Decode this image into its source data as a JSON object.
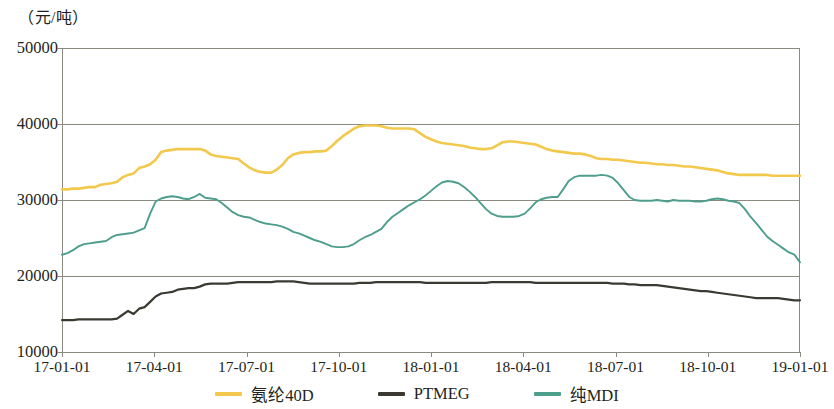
{
  "chart_data": {
    "type": "line",
    "title": "",
    "subtitle": "",
    "unit_label": "（元/吨）",
    "xlabel": "",
    "ylabel": "元/吨",
    "grid": true,
    "legend_position": "bottom",
    "ylim": [
      10000,
      50000
    ],
    "yticks": [
      50000,
      40000,
      30000,
      20000,
      10000
    ],
    "ytick_labels": [
      "50000",
      "40000",
      "30000",
      "20000",
      "10000"
    ],
    "xticks": [
      "17-01-01",
      "17-04-01",
      "17-07-01",
      "17-10-01",
      "18-01-01",
      "18-04-01",
      "18-07-01",
      "18-10-01",
      "19-01-01"
    ],
    "x_range": [
      "17-01-01",
      "19-01-01"
    ],
    "colors": {
      "spandex40d": "#f2c94c",
      "ptmeg": "#3a3a33",
      "puremdi": "#4d9e8c",
      "grid": "#8a8a80",
      "axis": "#8a8a80",
      "text": "#231f20"
    },
    "series": [
      {
        "name": "氨纶40D",
        "color": "#f2c94c",
        "values": [
          31400,
          31400,
          31500,
          31500,
          31600,
          31700,
          31700,
          32000,
          32100,
          32200,
          32400,
          33000,
          33300,
          33500,
          34200,
          34400,
          34700,
          35300,
          36300,
          36500,
          36600,
          36700,
          36700,
          36700,
          36700,
          36700,
          36500,
          36000,
          35800,
          35700,
          35600,
          35500,
          35400,
          34800,
          34300,
          33900,
          33700,
          33600,
          33600,
          34000,
          34600,
          35500,
          36000,
          36200,
          36300,
          36300,
          36400,
          36400,
          36500,
          37100,
          37800,
          38400,
          38900,
          39400,
          39700,
          39800,
          39800,
          39800,
          39700,
          39500,
          39400,
          39400,
          39400,
          39400,
          39300,
          38800,
          38300,
          38000,
          37700,
          37500,
          37400,
          37300,
          37200,
          37100,
          36900,
          36800,
          36700,
          36700,
          36800,
          37200,
          37600,
          37700,
          37700,
          37600,
          37500,
          37400,
          37300,
          37000,
          36700,
          36500,
          36400,
          36300,
          36200,
          36100,
          36100,
          36000,
          35800,
          35500,
          35400,
          35400,
          35300,
          35300,
          35200,
          35100,
          35000,
          34900,
          34900,
          34800,
          34700,
          34700,
          34600,
          34600,
          34500,
          34400,
          34400,
          34300,
          34200,
          34100,
          34000,
          33900,
          33700,
          33500,
          33400,
          33300,
          33300,
          33300,
          33300,
          33300,
          33300,
          33200,
          33200,
          33200,
          33200,
          33200,
          33200
        ]
      },
      {
        "name": "PTMEG",
        "color": "#3a3a33",
        "values": [
          14200,
          14200,
          14200,
          14300,
          14300,
          14300,
          14300,
          14300,
          14300,
          14300,
          14400,
          14900,
          15400,
          15000,
          15700,
          15900,
          16600,
          17300,
          17700,
          17800,
          17900,
          18200,
          18300,
          18400,
          18400,
          18600,
          18900,
          19000,
          19000,
          19000,
          19000,
          19100,
          19200,
          19200,
          19200,
          19200,
          19200,
          19200,
          19200,
          19300,
          19300,
          19300,
          19300,
          19200,
          19100,
          19000,
          19000,
          19000,
          19000,
          19000,
          19000,
          19000,
          19000,
          19000,
          19100,
          19100,
          19100,
          19200,
          19200,
          19200,
          19200,
          19200,
          19200,
          19200,
          19200,
          19200,
          19100,
          19100,
          19100,
          19100,
          19100,
          19100,
          19100,
          19100,
          19100,
          19100,
          19100,
          19100,
          19200,
          19200,
          19200,
          19200,
          19200,
          19200,
          19200,
          19200,
          19100,
          19100,
          19100,
          19100,
          19100,
          19100,
          19100,
          19100,
          19100,
          19100,
          19100,
          19100,
          19100,
          19100,
          19000,
          19000,
          19000,
          18900,
          18900,
          18800,
          18800,
          18800,
          18800,
          18700,
          18600,
          18500,
          18400,
          18300,
          18200,
          18100,
          18000,
          18000,
          17900,
          17800,
          17700,
          17600,
          17500,
          17400,
          17300,
          17200,
          17100,
          17100,
          17100,
          17100,
          17100,
          17000,
          16900,
          16800,
          16800
        ]
      },
      {
        "name": "纯MDI",
        "color": "#4d9e8c",
        "values": [
          22800,
          23000,
          23400,
          23900,
          24200,
          24300,
          24400,
          24500,
          24600,
          25100,
          25400,
          25500,
          25600,
          25700,
          26000,
          26300,
          28200,
          29800,
          30200,
          30400,
          30500,
          30400,
          30200,
          30100,
          30400,
          30800,
          30300,
          30200,
          30100,
          29600,
          29000,
          28400,
          28000,
          27800,
          27700,
          27400,
          27100,
          26900,
          26800,
          26700,
          26500,
          26200,
          25800,
          25600,
          25300,
          25000,
          24700,
          24500,
          24200,
          23900,
          23800,
          23800,
          23900,
          24200,
          24700,
          25100,
          25400,
          25800,
          26200,
          27100,
          27800,
          28300,
          28800,
          29300,
          29700,
          30100,
          30600,
          31200,
          31800,
          32300,
          32500,
          32400,
          32200,
          31700,
          31100,
          30400,
          29600,
          28800,
          28200,
          27900,
          27800,
          27800,
          27800,
          27900,
          28200,
          28900,
          29700,
          30100,
          30300,
          30400,
          30400,
          31400,
          32500,
          33000,
          33200,
          33200,
          33200,
          33200,
          33300,
          33200,
          32900,
          32200,
          31300,
          30400,
          30000,
          29900,
          29900,
          29900,
          30000,
          29900,
          29800,
          30000,
          29900,
          29900,
          29900,
          29800,
          29800,
          29900,
          30100,
          30200,
          30100,
          29900,
          29800,
          29600,
          28800,
          27800,
          27000,
          26100,
          25200,
          24600,
          24100,
          23600,
          23100,
          22800,
          21800
        ]
      }
    ],
    "plot_area": {
      "left": 62,
      "top": 48,
      "right": 800,
      "bottom": 352
    }
  },
  "legend": {
    "items": [
      {
        "label": "氨纶40D",
        "color": "#f2c94c"
      },
      {
        "label": "PTMEG",
        "color": "#3a3a33"
      },
      {
        "label": "纯MDI",
        "color": "#4d9e8c"
      }
    ]
  }
}
